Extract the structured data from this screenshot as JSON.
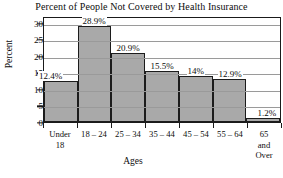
{
  "chart_data": {
    "type": "bar",
    "title": "Percent of People Not Covered by Health Insurance",
    "xlabel": "Ages",
    "ylabel": "Percent",
    "categories": [
      "Under 18",
      "18 – 24",
      "25 – 34",
      "35 – 44",
      "45 – 54",
      "55 – 64",
      "65 and Over"
    ],
    "category_lines": [
      [
        "Under",
        "18"
      ],
      [
        "18 – 24"
      ],
      [
        "25 – 34"
      ],
      [
        "35 – 44"
      ],
      [
        "45 – 54"
      ],
      [
        "55 – 64"
      ],
      [
        "65",
        "and",
        "Over"
      ]
    ],
    "values": [
      12.4,
      28.9,
      20.9,
      15.5,
      14,
      12.9,
      1.2
    ],
    "data_labels": [
      "12.4%",
      "28.9%",
      "20.9%",
      "15.5%",
      "14%",
      "12.9%",
      "1.2%"
    ],
    "ylim": [
      0,
      32
    ],
    "yticks": [
      0,
      5,
      10,
      15,
      20,
      25,
      30
    ],
    "ytick_labels": [
      "0",
      "5",
      "10",
      "15",
      "20",
      "25",
      "30"
    ],
    "grid": true,
    "legend": null,
    "bar_fill_color": "#a9a9a9",
    "bar_edge_color": "#1c1c1c",
    "axis_color": "#1a1a1a",
    "grid_color": "#9a9a9a",
    "background_color": "#ffffff"
  }
}
